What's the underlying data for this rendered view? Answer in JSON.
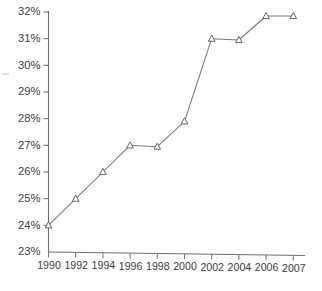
{
  "chart_data": {
    "type": "line",
    "title": "",
    "subtitle": "",
    "xlabel": "",
    "ylabel": "",
    "categories": [
      "1990",
      "1992",
      "1994",
      "1996",
      "1998",
      "2000",
      "2002",
      "2004",
      "2006",
      "2007"
    ],
    "x": [
      1990,
      1992,
      1994,
      1996,
      1998,
      2000,
      2002,
      2004,
      2006,
      2007
    ],
    "values": [
      24.0,
      25.0,
      26.0,
      27.0,
      26.95,
      27.9,
      31.0,
      30.95,
      31.85,
      31.85
    ],
    "value_labels": [
      "24%",
      "25%",
      "26%",
      "27%",
      "27%",
      "28%",
      "31%",
      "31%",
      "32%",
      "32%"
    ],
    "series": [
      {
        "name": "",
        "values": [
          24.0,
          25.0,
          26.0,
          27.0,
          26.95,
          27.9,
          31.0,
          30.95,
          31.85,
          31.85
        ],
        "marker": "open-triangle",
        "color": "#76767c"
      }
    ],
    "ylim": [
      23,
      32
    ],
    "xlim": [
      1990,
      2007
    ],
    "yticks": [
      23,
      24,
      25,
      26,
      27,
      28,
      29,
      30,
      31,
      32
    ],
    "ytick_labels": [
      "23%",
      "24%",
      "25%",
      "26%",
      "27%",
      "28%",
      "29%",
      "30%",
      "31%",
      "32%"
    ],
    "grid": false,
    "legend": false,
    "legend_position": "none",
    "annotations": []
  },
  "axes": {
    "y_axis_name": "percent-axis",
    "x_axis_name": "year-axis"
  },
  "colors": {
    "line": "#76767c",
    "marker_stroke": "#5d5d63",
    "marker_fill": "#ffffff",
    "axis": "#6e6e72",
    "text": "#3b3b3f",
    "background": "#ffffff"
  }
}
